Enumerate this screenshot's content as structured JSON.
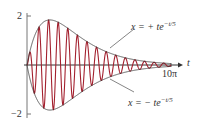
{
  "chart_data": {
    "type": "line",
    "title": "",
    "xlabel": "t",
    "ylabel": "",
    "xlim": [
      0,
      31.4159
    ],
    "ylim": [
      -2,
      2
    ],
    "x_tick_labels": [
      "10π"
    ],
    "y_tick_labels": [
      "2",
      "-2"
    ],
    "grid": false,
    "series": [
      {
        "name": "x = t e^(-t/5) sin(3t)",
        "role": "oscillation",
        "color": "#a3202e",
        "cycles": 15
      },
      {
        "name": "x = + t e^(-t/5)",
        "role": "upper-envelope",
        "color": "#333333"
      },
      {
        "name": "x = - t e^(-t/5)",
        "role": "lower-envelope",
        "color": "#333333"
      }
    ],
    "annotations": [
      {
        "text": "x = + te^(-t/5)",
        "points_to": "upper-envelope"
      },
      {
        "text": "x = − te^(-t/5)",
        "points_to": "lower-envelope"
      }
    ],
    "envelope_peak": {
      "t": 5,
      "value": 1.84
    }
  },
  "labels": {
    "y_top": "2",
    "y_bottom": "−2",
    "x_end": "10π",
    "x_axis": "t",
    "upper_eq_main": "x = + te",
    "upper_eq_exp": "−t/5",
    "lower_eq_main": "x = − te",
    "lower_eq_exp": "−t/5"
  },
  "colors": {
    "oscillation": "#a3202e",
    "envelope": "#333333",
    "axis": "#555555"
  }
}
